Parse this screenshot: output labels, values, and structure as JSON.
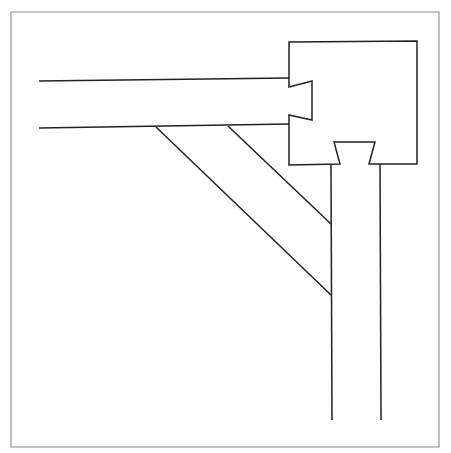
{
  "diagram": {
    "title": "",
    "colors": {
      "background": "#ffffff",
      "frame": "#9a9a9a",
      "stroke": "#222222"
    },
    "frame": {
      "x": 11,
      "y": 12,
      "width": 428,
      "height": 435
    },
    "beam": {
      "top_line": {
        "x1": 39,
        "y1": 81,
        "x2": 289,
        "y2": 78
      },
      "bottom_line": {
        "x1": 39,
        "y1": 128,
        "x2": 289,
        "y2": 124
      }
    },
    "block": {
      "points": "289,42 417,41 417,164 369,164 375,142 334,142 340,164 289,165 289,115 312,120 312,81 289,87"
    },
    "post": {
      "left_line": {
        "x1": 331,
        "y1": 165,
        "x2": 332,
        "y2": 420
      },
      "right_line": {
        "x1": 380,
        "y1": 164,
        "x2": 381,
        "y2": 420
      }
    },
    "brace": {
      "upper_line": {
        "x1": 228,
        "y1": 126,
        "x2": 331,
        "y2": 224
      },
      "lower_line": {
        "x1": 156,
        "y1": 127,
        "x2": 331,
        "y2": 295
      }
    }
  }
}
